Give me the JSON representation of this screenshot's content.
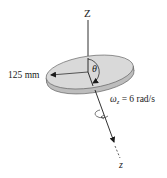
{
  "diagram": {
    "type": "rotating-disk-kinematics",
    "labels": {
      "vertical_axis": "Z",
      "spin_axis": "z",
      "angle": "θ",
      "radius": "125 mm",
      "angular_velocity_symbol": "ω",
      "angular_velocity_subscript": "z",
      "angular_velocity_value": " = 6 rad/s"
    },
    "colors": {
      "disk_top": "#d9d9d9",
      "disk_edge": "#bdbdbd",
      "stroke": "#1a1a1a",
      "background": "#ffffff"
    }
  }
}
